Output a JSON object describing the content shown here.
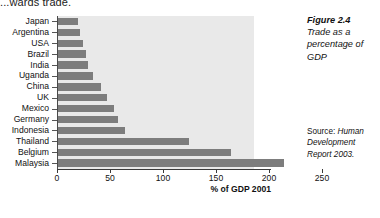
{
  "top_text": "...wards trade.",
  "caption": {
    "figure_number": "Figure 2.4",
    "text": "Trade as a percentage of GDP"
  },
  "source": {
    "label": "Source:",
    "reference": "Human Development Report 2003."
  },
  "chart_data": {
    "type": "bar",
    "orientation": "horizontal",
    "title": "Trade as a percentage of GDP",
    "xlabel": "% of GDP 2001",
    "ylabel": "",
    "xlim": [
      0,
      250
    ],
    "xticks": [
      0,
      50,
      100,
      150,
      200,
      250
    ],
    "xtick_labels": [
      "0",
      "50",
      "100",
      "150",
      "200",
      "250"
    ],
    "grid": false,
    "legend": false,
    "bar_color": "#7d7d7d",
    "plot_background": "#e9e9e9",
    "categories": [
      "Japan",
      "Argentina",
      "USA",
      "Brazil",
      "India",
      "Uganda",
      "China",
      "UK",
      "Mexico",
      "Germany",
      "Indonesia",
      "Thailand",
      "Belgium",
      "Malaysia"
    ],
    "values": [
      19,
      21,
      24,
      26,
      28,
      33,
      41,
      46,
      53,
      57,
      63,
      124,
      163,
      213
    ]
  }
}
